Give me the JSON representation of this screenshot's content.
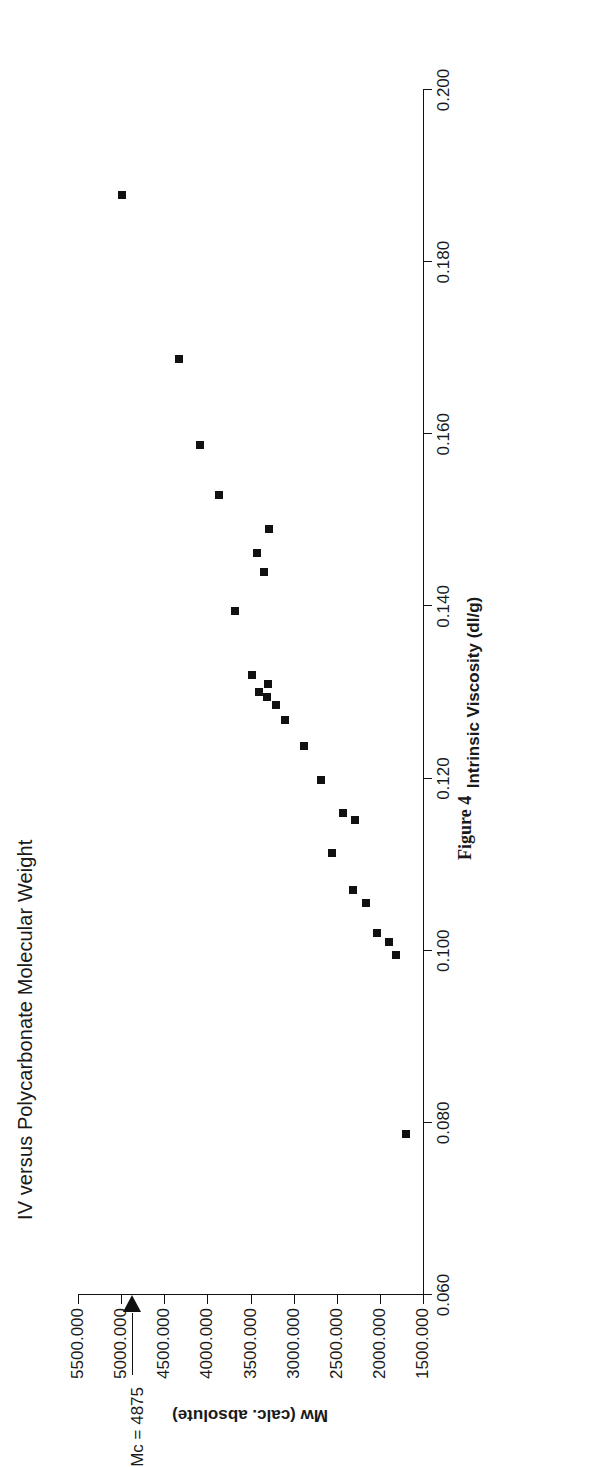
{
  "chart_data": {
    "type": "scatter",
    "title": "IV versus Polycarbonate Molecular Weight",
    "caption": "Figure 4",
    "xlabel": "Intrinsic Viscosity (dl/g)",
    "ylabel": "Mw (calc. absolute)",
    "xlim": [
      0.06,
      0.2
    ],
    "ylim": [
      1500.0,
      5500.0
    ],
    "grid": false,
    "legend": null,
    "orientation": "page rotated 90 degrees (landscape figure on portrait page)",
    "xticks": [
      "0.060",
      "0.080",
      "0.100",
      "0.120",
      "0.140",
      "0.160",
      "0.180",
      "0.200"
    ],
    "xtick_values": [
      0.06,
      0.08,
      0.1,
      0.12,
      0.14,
      0.16,
      0.18,
      0.2
    ],
    "yticks": [
      "1500.000",
      "2000.000",
      "2500.000",
      "3000.000",
      "3500.000",
      "4000.000",
      "4500.000",
      "5000.000",
      "5500.000"
    ],
    "ytick_values": [
      1500,
      2000,
      2500,
      3000,
      3500,
      4000,
      4500,
      5000,
      5500
    ],
    "marker": {
      "shape": "square",
      "color": "#111111",
      "size": 8
    },
    "annotations": [
      {
        "text": "Mc = 4875",
        "type": "arrow-to-axis",
        "axis": "y",
        "value": 4875
      }
    ],
    "points": [
      {
        "x": 0.0787,
        "y": 1700
      },
      {
        "x": 0.0995,
        "y": 1810
      },
      {
        "x": 0.101,
        "y": 1900
      },
      {
        "x": 0.102,
        "y": 2030
      },
      {
        "x": 0.1055,
        "y": 2160
      },
      {
        "x": 0.107,
        "y": 2310
      },
      {
        "x": 0.1113,
        "y": 2550
      },
      {
        "x": 0.1152,
        "y": 2290
      },
      {
        "x": 0.116,
        "y": 2430
      },
      {
        "x": 0.1198,
        "y": 2680
      },
      {
        "x": 0.1238,
        "y": 2880
      },
      {
        "x": 0.1268,
        "y": 3100
      },
      {
        "x": 0.1285,
        "y": 3210
      },
      {
        "x": 0.1295,
        "y": 3310
      },
      {
        "x": 0.13,
        "y": 3400
      },
      {
        "x": 0.131,
        "y": 3300
      },
      {
        "x": 0.132,
        "y": 3480
      },
      {
        "x": 0.1395,
        "y": 3680
      },
      {
        "x": 0.144,
        "y": 3340
      },
      {
        "x": 0.1462,
        "y": 3420
      },
      {
        "x": 0.149,
        "y": 3290
      },
      {
        "x": 0.153,
        "y": 3860
      },
      {
        "x": 0.1588,
        "y": 4090
      },
      {
        "x": 0.1688,
        "y": 4330
      },
      {
        "x": 0.1878,
        "y": 4990
      }
    ]
  }
}
